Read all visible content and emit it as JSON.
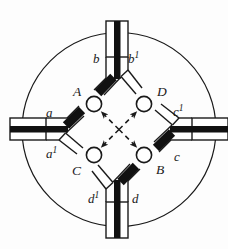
{
  "diagram": {
    "type": "optical-waveguide-coupler-schematic",
    "shape": "circular",
    "nodes": [
      {
        "id": "A",
        "label": "A",
        "position": "upper-left",
        "cx": 94,
        "cy": 104
      },
      {
        "id": "D",
        "label": "D",
        "position": "upper-right",
        "cx": 144,
        "cy": 104
      },
      {
        "id": "C",
        "label": "C",
        "position": "lower-left",
        "cx": 94,
        "cy": 155
      },
      {
        "id": "B",
        "label": "B",
        "position": "lower-right",
        "cx": 144,
        "cy": 155
      }
    ],
    "ports": [
      {
        "id": "top",
        "label_dark": "b",
        "label_light": "b",
        "label_light_sup": "1",
        "dark_branch": "left",
        "light_branch": "right",
        "dark_label_pos": "top-left",
        "light_label_pos": "top-right"
      },
      {
        "id": "right",
        "label_dark": "c",
        "label_light": "c",
        "label_light_sup": "1",
        "dark_branch": "lower",
        "light_branch": "upper",
        "dark_label_pos": "right-lower",
        "light_label_pos": "right-upper"
      },
      {
        "id": "bottom",
        "label_dark": "d",
        "label_light": "d",
        "label_light_sup": "1",
        "dark_branch": "right",
        "light_branch": "left",
        "dark_label_pos": "bottom-right",
        "light_label_pos": "bottom-left"
      },
      {
        "id": "left",
        "label_dark": "a",
        "label_light": "a",
        "label_light_sup": "1",
        "dark_branch": "upper",
        "light_branch": "lower",
        "dark_label_pos": "left-upper",
        "light_label_pos": "left-lower"
      }
    ],
    "labels": {
      "a": "a",
      "a1": "a",
      "a1_sup": "1",
      "b": "b",
      "b1": "b",
      "b1_sup": "1",
      "c": "c",
      "c1": "c",
      "c1_sup": "1",
      "d": "d",
      "d1": "d",
      "d1_sup": "1",
      "A": "A",
      "B": "B",
      "C": "C",
      "D": "D"
    },
    "internal_links": {
      "style": "dashed",
      "arrowheads": "inward-to-nodes",
      "pattern": "X-crossing through center",
      "paths": [
        {
          "from": "center",
          "to": "A"
        },
        {
          "from": "center",
          "to": "B"
        },
        {
          "from": "center",
          "to": "C"
        },
        {
          "from": "center",
          "to": "D"
        }
      ]
    },
    "colors": {
      "ink": "#1a1a1a",
      "fill_dark": "#111111",
      "fill_light": "#ffffff",
      "background": "#fdfdfd",
      "circle_boundary": "#1a1a1a"
    }
  }
}
